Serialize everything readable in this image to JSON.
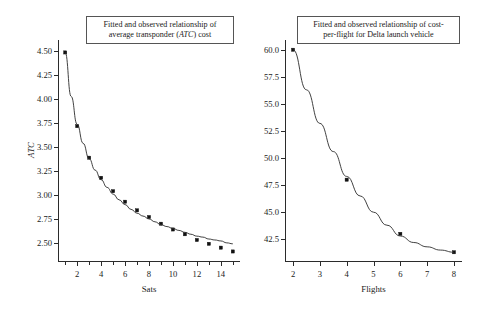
{
  "figure": {
    "background": "#ffffff",
    "marker_color": "#111111",
    "curve_color": "#2b2b2b"
  },
  "panels": [
    {
      "id": "left",
      "title_line1": "Fitted and observed relationship of",
      "title_line2_pre": "average transponder (",
      "title_line2_em": "ATC",
      "title_line2_post": ") cost",
      "xlabel": "Sats",
      "ylabel": "ATC"
    },
    {
      "id": "right",
      "title_line1": "Fitted and observed relationship of cost-",
      "title_line2": "per-flight for Delta launch vehicle",
      "xlabel": "Flights",
      "ylabel": ""
    }
  ],
  "chart_data": [
    {
      "type": "line",
      "title": "Fitted and observed relationship of average transponder (ATC) cost",
      "xlabel": "Sats",
      "ylabel": "ATC",
      "xlim": [
        0.4,
        15.6
      ],
      "ylim": [
        2.3,
        4.62
      ],
      "grid": false,
      "legend": "none",
      "xticks": [
        2,
        4,
        6,
        8,
        10,
        12,
        14
      ],
      "xticks_minor": [
        1,
        3,
        5,
        7,
        9,
        11,
        13,
        15
      ],
      "yticks": [
        2.5,
        2.75,
        3.0,
        3.25,
        3.5,
        3.75,
        4.0,
        4.25,
        4.5
      ],
      "ytick_labels": [
        "2.50",
        "2.75",
        "3.00",
        "3.25",
        "3.50",
        "3.75",
        "4.00",
        "4.25",
        "4.50"
      ],
      "xtick_labels": [
        "2",
        "4",
        "6",
        "8",
        "10",
        "12",
        "14"
      ],
      "series": [
        {
          "name": "observed",
          "style": "markers",
          "x": [
            1,
            2,
            3,
            4,
            5,
            6,
            7,
            8,
            9,
            10,
            11,
            12,
            13,
            14,
            15
          ],
          "values": [
            4.49,
            3.72,
            3.39,
            3.18,
            3.04,
            2.93,
            2.84,
            2.77,
            2.7,
            2.64,
            2.59,
            2.53,
            2.49,
            2.45,
            2.41
          ]
        },
        {
          "name": "fitted",
          "style": "line",
          "equation": "ATC = 2.00 + 2.50 / Sats",
          "x": [
            1,
            1.5,
            2,
            2.5,
            3,
            3.5,
            4,
            4.5,
            5,
            5.5,
            6,
            6.5,
            7,
            7.5,
            8,
            8.5,
            9,
            9.5,
            10,
            10.5,
            11,
            11.5,
            12,
            12.5,
            13,
            13.5,
            14,
            14.5,
            15
          ],
          "values": [
            4.49,
            4.03,
            3.74,
            3.54,
            3.38,
            3.26,
            3.16,
            3.08,
            3.01,
            2.95,
            2.9,
            2.85,
            2.81,
            2.78,
            2.75,
            2.72,
            2.69,
            2.67,
            2.65,
            2.63,
            2.61,
            2.59,
            2.57,
            2.56,
            2.54,
            2.53,
            2.52,
            2.5,
            2.49
          ]
        }
      ]
    },
    {
      "type": "line",
      "title": "Fitted and observed relationship of cost-per-flight for Delta launch vehicle",
      "xlabel": "Flights",
      "ylabel": "",
      "xlim": [
        1.7,
        8.3
      ],
      "ylim": [
        40.4,
        60.9
      ],
      "grid": false,
      "legend": "none",
      "xticks": [
        2,
        3,
        4,
        5,
        6,
        7,
        8
      ],
      "yticks": [
        42.5,
        45.0,
        47.5,
        50.0,
        52.5,
        55.0,
        57.5,
        60.0
      ],
      "ytick_labels": [
        "42.5",
        "45.0",
        "47.5",
        "50.0",
        "52.5",
        "55.0",
        "57.5",
        "60.0"
      ],
      "xtick_labels": [
        "2",
        "3",
        "4",
        "5",
        "6",
        "7",
        "8"
      ],
      "series": [
        {
          "name": "observed",
          "style": "markers",
          "x": [
            2,
            4,
            6,
            8
          ],
          "values": [
            60.0,
            48.0,
            43.0,
            41.3
          ]
        },
        {
          "name": "fitted",
          "style": "line",
          "equation": "cost = 40.2 + 52.6 * exp(-0.57 * Flights)",
          "x": [
            2,
            2.5,
            3,
            3.5,
            4,
            4.5,
            5,
            5.5,
            6,
            6.5,
            7,
            7.5,
            8
          ],
          "values": [
            60.0,
            56.3,
            53.2,
            50.6,
            48.3,
            46.5,
            45.0,
            43.8,
            42.8,
            42.2,
            41.8,
            41.5,
            41.3
          ]
        }
      ]
    }
  ]
}
